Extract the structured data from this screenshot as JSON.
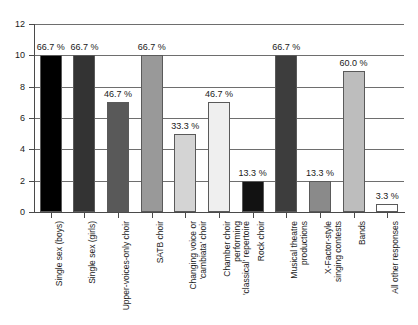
{
  "chart_data": {
    "type": "bar",
    "title": "",
    "subtitle": "",
    "xlabel": "",
    "ylabel": "",
    "ylim": [
      0,
      12
    ],
    "ytick_values": [
      0,
      2,
      4,
      6,
      8,
      10,
      12
    ],
    "ytick_labels": [
      "0",
      "2",
      "4",
      "6",
      "8",
      "10",
      "12"
    ],
    "grid": true,
    "legend": "none",
    "categories": [
      "Single sex (boys)",
      "Single sex (girls)",
      "Upper-voices-only choir",
      "SATB choir",
      "Changing voice or\n'cambiata' choir",
      "Chamber choir\nperforming\n'classical' repertoire",
      "Rock choir",
      "Musical theatre\nproductions",
      "X-Factor-style\nsinging contests",
      "Bands",
      "All other responses"
    ],
    "values": [
      10,
      10,
      7,
      10,
      5,
      7,
      2,
      10,
      2,
      9,
      0.5
    ],
    "data_labels": [
      "66.7 %",
      "66.7 %",
      "46.7 %",
      "66.7 %",
      "33.3 %",
      "46.7 %",
      "13.3 %",
      "66.7 %",
      "13.3 %",
      "60.0 %",
      "3.3 %"
    ],
    "bar_colors": [
      "#000000",
      "#333333",
      "#595959",
      "#999999",
      "#d4d4d4",
      "#efefef",
      "#121212",
      "#3d3d3d",
      "#8a8a8a",
      "#bdbdbd",
      "#ffffff"
    ],
    "bar_edge_color": "#5a5a5a",
    "axis_color": "#4a4a4a",
    "gridline_color": "#6e6e6e",
    "background_color": "#ffffff",
    "text_color": "#1a1a1a"
  }
}
